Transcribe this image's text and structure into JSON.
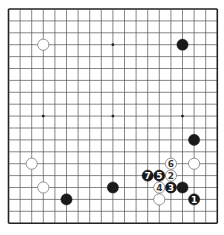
{
  "board": {
    "size": 19,
    "origin_x": 8.5,
    "origin_y": 9,
    "spacing_x": 11.6,
    "spacing_y": 11.9,
    "stone_radius": 5.6,
    "colors": {
      "background": "#ffffff",
      "line": "#555555",
      "border": "#222222",
      "black_stone": "#1a1a1a",
      "white_stone": "#ffffff",
      "white_stroke": "#777777",
      "black_label": "#ffffff",
      "white_label": "#333333"
    },
    "star_points": [
      [
        3,
        3
      ],
      [
        9,
        3
      ],
      [
        15,
        3
      ],
      [
        3,
        9
      ],
      [
        9,
        9
      ],
      [
        15,
        9
      ],
      [
        3,
        15
      ],
      [
        9,
        15
      ],
      [
        15,
        15
      ]
    ],
    "stones": [
      {
        "color": "white",
        "col": 3,
        "row": 3,
        "label": ""
      },
      {
        "color": "black",
        "col": 15,
        "row": 3,
        "label": ""
      },
      {
        "color": "black",
        "col": 16,
        "row": 11,
        "label": ""
      },
      {
        "color": "white",
        "col": 16,
        "row": 13,
        "label": ""
      },
      {
        "color": "white",
        "col": 2,
        "row": 13,
        "label": ""
      },
      {
        "color": "white",
        "col": 3,
        "row": 15,
        "label": ""
      },
      {
        "color": "black",
        "col": 5,
        "row": 16,
        "label": ""
      },
      {
        "color": "black",
        "col": 9,
        "row": 15,
        "label": ""
      },
      {
        "color": "white",
        "col": 13,
        "row": 16,
        "label": ""
      },
      {
        "color": "black",
        "col": 15,
        "row": 15,
        "label": ""
      },
      {
        "color": "black",
        "col": 16,
        "row": 16,
        "label": "1"
      },
      {
        "color": "white",
        "col": 14,
        "row": 14,
        "label": "2"
      },
      {
        "color": "black",
        "col": 14,
        "row": 15,
        "label": "3"
      },
      {
        "color": "white",
        "col": 13,
        "row": 15,
        "label": "4"
      },
      {
        "color": "black",
        "col": 13,
        "row": 14,
        "label": "5"
      },
      {
        "color": "white",
        "col": 14,
        "row": 13,
        "label": "6"
      },
      {
        "color": "black",
        "col": 12,
        "row": 14,
        "label": "7"
      }
    ]
  }
}
